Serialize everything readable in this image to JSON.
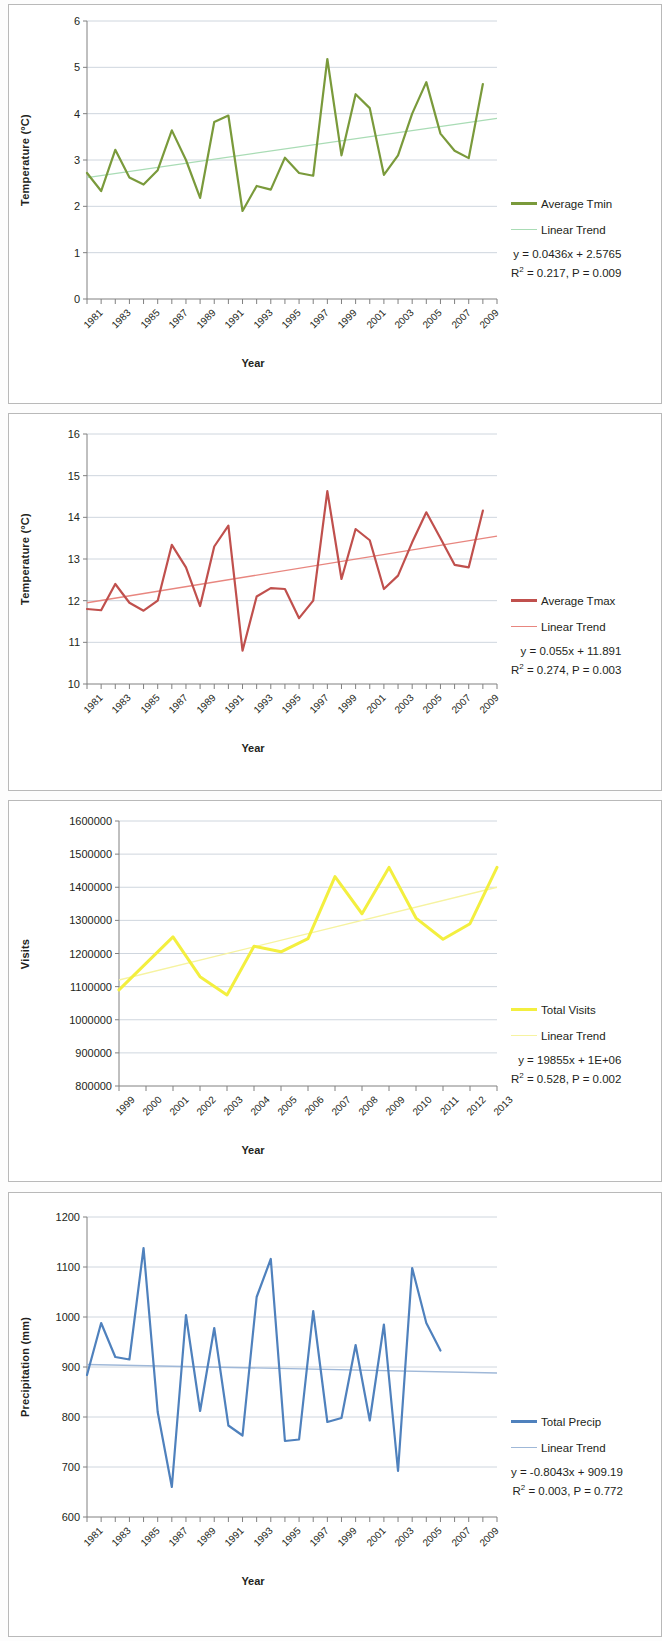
{
  "page": {
    "panel_count": 4
  },
  "charts": [
    {
      "id": "tmin",
      "ylabel": "Temperature (°C)",
      "xlabel": "Year",
      "series_name": "Average Tmin",
      "trend_name": "Linear Trend",
      "equation": "y = 0.0436x + 2.5765",
      "stats_prefix": "R",
      "stats_sup": "2",
      "stats": " = 0.217, P = 0.009",
      "color": "#7a9a3b",
      "trend_color": "#a9dcb5",
      "yticks": [
        "0",
        "1",
        "2",
        "3",
        "4",
        "5",
        "6"
      ],
      "xticks": [
        "1981",
        "1983",
        "1985",
        "1987",
        "1989",
        "1991",
        "1993",
        "1995",
        "1997",
        "1999",
        "2001",
        "2003",
        "2005",
        "2007",
        "2009"
      ]
    },
    {
      "id": "tmax",
      "ylabel": "Temperature (°C)",
      "xlabel": "Year",
      "series_name": "Average Tmax",
      "trend_name": "Linear Trend",
      "equation": "y = 0.055x + 11.891",
      "stats_prefix": "R",
      "stats_sup": "2",
      "stats": " = 0.274, P = 0.003",
      "color": "#c0504d",
      "trend_color": "#e8867f",
      "yticks": [
        "10",
        "11",
        "12",
        "13",
        "14",
        "15",
        "16"
      ],
      "xticks": [
        "1981",
        "1983",
        "1985",
        "1987",
        "1989",
        "1991",
        "1993",
        "1995",
        "1997",
        "1999",
        "2001",
        "2003",
        "2005",
        "2007",
        "2009"
      ]
    },
    {
      "id": "visits",
      "ylabel": "Visits",
      "xlabel": "Year",
      "series_name": "Total Visits",
      "trend_name": "Linear Trend",
      "equation": "y = 19855x + 1E+06",
      "stats_prefix": "R",
      "stats_sup": "2",
      "stats": " = 0.528, P = 0.002",
      "color": "#f3ef3f",
      "trend_color": "#f6f3a0",
      "yticks": [
        "800000",
        "900000",
        "1000000",
        "1100000",
        "1200000",
        "1300000",
        "1400000",
        "1500000",
        "1600000"
      ],
      "xticks": [
        "1999",
        "2000",
        "2001",
        "2002",
        "2003",
        "2004",
        "2005",
        "2006",
        "2007",
        "2008",
        "2009",
        "2010",
        "2011",
        "2012",
        "2013"
      ]
    },
    {
      "id": "precip",
      "ylabel": "Precipitation (mm)",
      "xlabel": "Year",
      "series_name": "Total Precip",
      "trend_name": "Linear Trend",
      "equation": "y = -0.8043x + 909.19",
      "stats_prefix": "R",
      "stats_sup": "2",
      "stats": " = 0.003, P = 0.772",
      "color": "#4f81bd",
      "trend_color": "#9fb8d8",
      "yticks": [
        "600",
        "700",
        "800",
        "900",
        "1000",
        "1100",
        "1200"
      ],
      "xticks": [
        "1981",
        "1983",
        "1985",
        "1987",
        "1989",
        "1991",
        "1993",
        "1995",
        "1997",
        "1999",
        "2001",
        "2003",
        "2005",
        "2007",
        "2009"
      ]
    }
  ],
  "chart_data": [
    {
      "type": "line",
      "title": "",
      "xlabel": "Year",
      "ylabel": "Temperature (°C)",
      "ylim": [
        0,
        6
      ],
      "xlim": [
        1981,
        2010
      ],
      "grid": true,
      "legend_position": "right",
      "annotations": [
        "y = 0.0436x + 2.5765",
        "R² = 0.217, P = 0.009"
      ],
      "series": [
        {
          "name": "Average Tmin",
          "color": "#7a9a3b",
          "x": [
            1981,
            1982,
            1983,
            1984,
            1985,
            1986,
            1987,
            1988,
            1989,
            1990,
            1991,
            1992,
            1993,
            1994,
            1995,
            1996,
            1997,
            1998,
            1999,
            2000,
            2001,
            2002,
            2003,
            2004,
            2005,
            2006,
            2007,
            2008,
            2009,
            2010
          ],
          "values": [
            2.72,
            2.33,
            3.22,
            2.62,
            2.47,
            2.78,
            3.64,
            3.0,
            2.18,
            3.82,
            3.96,
            1.9,
            2.44,
            2.36,
            3.05,
            2.72,
            2.66,
            5.18,
            3.1,
            4.42,
            4.12,
            2.68,
            3.1,
            4.0,
            4.68,
            3.57,
            3.2,
            3.04,
            4.64
          ]
        },
        {
          "name": "Linear Trend",
          "color": "#a9dcb5",
          "type": "trend",
          "equation": "y = 0.0436x + 2.5765",
          "r2": 0.217,
          "p": 0.009,
          "endpoints": [
            2.62,
            3.9
          ]
        }
      ]
    },
    {
      "type": "line",
      "title": "",
      "xlabel": "Year",
      "ylabel": "Temperature (°C)",
      "ylim": [
        10,
        16
      ],
      "xlim": [
        1981,
        2010
      ],
      "grid": true,
      "legend_position": "right",
      "annotations": [
        "y = 0.055x + 11.891",
        "R² = 0.274, P = 0.003"
      ],
      "series": [
        {
          "name": "Average Tmax",
          "color": "#c0504d",
          "x": [
            1981,
            1982,
            1983,
            1984,
            1985,
            1986,
            1987,
            1988,
            1989,
            1990,
            1991,
            1992,
            1993,
            1994,
            1995,
            1996,
            1997,
            1998,
            1999,
            2000,
            2001,
            2002,
            2003,
            2004,
            2005,
            2006,
            2007,
            2008,
            2009,
            2010
          ],
          "values": [
            11.8,
            11.77,
            12.4,
            11.95,
            11.76,
            12.0,
            13.34,
            12.8,
            11.87,
            13.3,
            13.8,
            10.8,
            12.1,
            12.3,
            12.28,
            11.58,
            12.0,
            14.63,
            12.52,
            13.72,
            13.45,
            12.28,
            12.6,
            13.4,
            14.12,
            13.5,
            12.86,
            12.8,
            14.16
          ]
        },
        {
          "name": "Linear Trend",
          "color": "#e8867f",
          "type": "trend",
          "equation": "y = 0.055x + 11.891",
          "r2": 0.274,
          "p": 0.003,
          "endpoints": [
            11.95,
            13.55
          ]
        }
      ]
    },
    {
      "type": "line",
      "title": "",
      "xlabel": "Year",
      "ylabel": "Visits",
      "ylim": [
        800000,
        1600000
      ],
      "xlim": [
        1999,
        2013
      ],
      "grid": true,
      "legend_position": "right",
      "annotations": [
        "y = 19855x + 1E+06",
        "R² = 0.528, P = 0.002"
      ],
      "series": [
        {
          "name": "Total Visits",
          "color": "#f3ef3f",
          "x": [
            1999,
            2000,
            2001,
            2002,
            2003,
            2004,
            2005,
            2006,
            2007,
            2008,
            2009,
            2010,
            2011,
            2012,
            2013
          ],
          "values": [
            1090000,
            1170000,
            1250000,
            1130000,
            1075000,
            1222000,
            1205000,
            1245000,
            1432000,
            1320000,
            1460000,
            1307000,
            1243000,
            1290000,
            1460000
          ]
        },
        {
          "name": "Linear Trend",
          "color": "#f6f3a0",
          "type": "trend",
          "equation": "y = 19855x + 1E+06",
          "r2": 0.528,
          "p": 0.002,
          "endpoints": [
            1120000,
            1400000
          ]
        }
      ]
    },
    {
      "type": "line",
      "title": "",
      "xlabel": "Year",
      "ylabel": "Precipitation (mm)",
      "ylim": [
        600,
        1200
      ],
      "xlim": [
        1981,
        2010
      ],
      "grid": true,
      "legend_position": "right",
      "annotations": [
        "y = -0.8043x + 909.19",
        "R² = 0.003, P = 0.772"
      ],
      "series": [
        {
          "name": "Total Precip",
          "color": "#4f81bd",
          "x": [
            1981,
            1982,
            1983,
            1984,
            1985,
            1986,
            1987,
            1988,
            1989,
            1990,
            1991,
            1992,
            1993,
            1994,
            1995,
            1996,
            1997,
            1998,
            1999,
            2000,
            2001,
            2002,
            2003,
            2004,
            2005,
            2006,
            2007,
            2008,
            2009,
            2010
          ],
          "values": [
            884,
            988,
            920,
            915,
            1138,
            810,
            660,
            1004,
            812,
            978,
            783,
            763,
            1040,
            1116,
            752,
            755,
            1012,
            790,
            798,
            944,
            793,
            985,
            692,
            1098,
            988,
            933
          ]
        },
        {
          "name": "Linear Trend",
          "color": "#9fb8d8",
          "type": "trend",
          "equation": "y = -0.8043x + 909.19",
          "r2": 0.003,
          "p": 0.772,
          "endpoints": [
            905,
            888
          ]
        }
      ]
    }
  ]
}
